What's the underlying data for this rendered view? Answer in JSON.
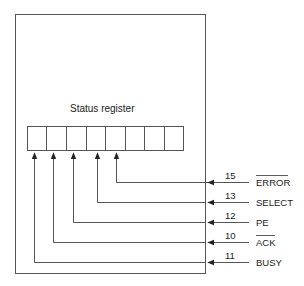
{
  "diagram": {
    "title": "Status register",
    "register_cells": 8,
    "colors": {
      "line": "#555555",
      "text": "#222222"
    },
    "signals": [
      {
        "pin": "15",
        "name": "ERROR",
        "overline": true,
        "bit": 4
      },
      {
        "pin": "13",
        "name": "SELECT",
        "overline": false,
        "bit": 3
      },
      {
        "pin": "12",
        "name": "PE",
        "overline": false,
        "bit": 2
      },
      {
        "pin": "10",
        "name": "ACK",
        "overline": true,
        "bit": 1
      },
      {
        "pin": "11",
        "name": "BUSY",
        "overline": false,
        "bit": 0
      }
    ]
  }
}
